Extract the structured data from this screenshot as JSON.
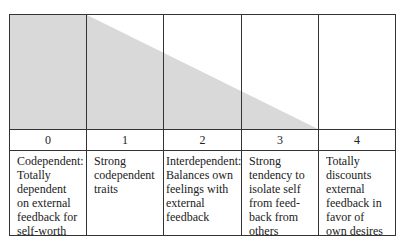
{
  "diagram": {
    "shade_color": "#d9d9d9",
    "columns": [
      {
        "number": "0",
        "description": "Codependent: Totally dependent on external feedback for self-worth",
        "lines": [
          "Codependent:",
          "Totally",
          "dependent",
          "on external",
          "feedback for",
          "self-worth"
        ]
      },
      {
        "number": "1",
        "description": "Strong codependent traits",
        "lines": [
          "Strong",
          "codependent",
          "traits"
        ]
      },
      {
        "number": "2",
        "description": "Interdependent: Balances own feelings with external feedback",
        "lines": [
          "Interdependent:",
          "Balances own",
          "feelings with",
          "external",
          "feedback"
        ]
      },
      {
        "number": "3",
        "description": "Strong tendency to isolate self from feed-back from others",
        "lines": [
          "Strong",
          "tendency to",
          "isolate self",
          "from feed-",
          "back from",
          "others"
        ]
      },
      {
        "number": "4",
        "description": "Totally discounts external feedback in favor of own desires",
        "lines": [
          "Totally",
          "discounts",
          "external",
          "feedback in",
          "favor of",
          "own desires"
        ]
      }
    ]
  }
}
